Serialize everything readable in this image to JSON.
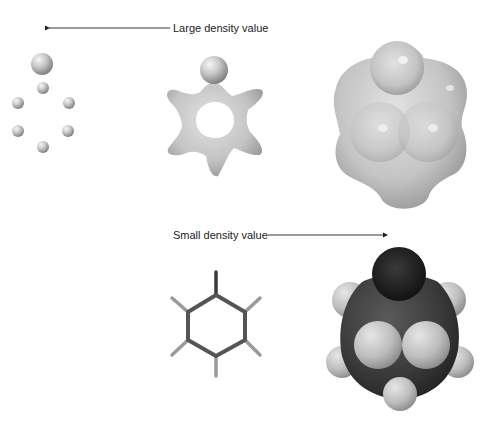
{
  "labels": {
    "large": "Large density value",
    "small": "Small density value"
  },
  "colors": {
    "surface": "#c8c8c8",
    "carbon": "#1a1a1a",
    "hydrogen": "#bdbdbd",
    "text": "#222222",
    "arrow": "#222222"
  },
  "panels": [
    {
      "name": "large-density-isosurface",
      "description": "Isolated atomic spheres"
    },
    {
      "name": "medium-density-isosurface",
      "description": "Star-shaped bonded surface"
    },
    {
      "name": "small-density-isosurface",
      "description": "Smooth enveloping surface"
    },
    {
      "name": "stick-model",
      "description": "Ball-and-stick skeleton"
    },
    {
      "name": "space-filling-model",
      "description": "Space-filling atoms"
    }
  ]
}
